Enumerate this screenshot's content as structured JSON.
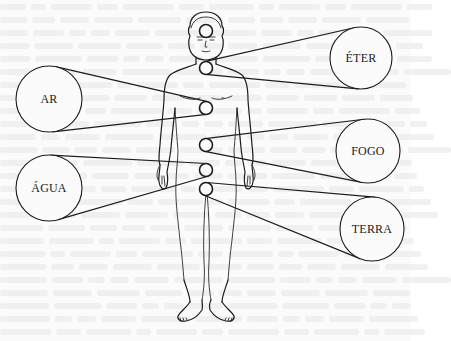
{
  "figure": {
    "elements": [
      {
        "id": "eter",
        "label": "ÉTER",
        "side": "right",
        "body_point": "throat"
      },
      {
        "id": "ar",
        "label": "AR",
        "side": "left",
        "body_point": "chest"
      },
      {
        "id": "fogo",
        "label": "FOGO",
        "side": "right",
        "body_point": "solar-plexus"
      },
      {
        "id": "agua",
        "label": "ÁGUA",
        "side": "left",
        "body_point": "sacral"
      },
      {
        "id": "terra",
        "label": "TERRA",
        "side": "right",
        "body_point": "root"
      }
    ],
    "body_points": [
      "crown",
      "throat",
      "chest",
      "solar-plexus",
      "sacral",
      "root"
    ]
  }
}
